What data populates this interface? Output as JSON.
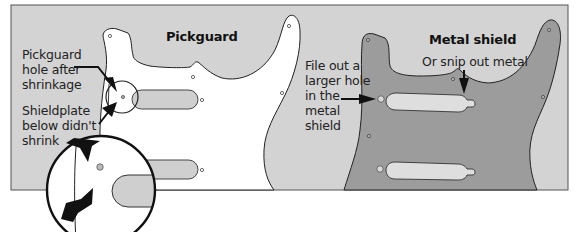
{
  "figure": {
    "panel_color": "#d3d3d3",
    "pickguard_color": "#ffffff",
    "shield_color": "#9c9c9c",
    "slot_color": "#cfcfcf",
    "outline_color": "#222222"
  },
  "left_panel": {
    "title": "Pickguard",
    "callouts": [
      {
        "text": "Pickguard\nhole after\nshrinkage",
        "points_to": "pickguard-hole"
      },
      {
        "text": "Shieldplate\nbelow didn't\nshrink",
        "points_to": "shieldplate-edge"
      }
    ]
  },
  "right_panel": {
    "title": "Metal shield",
    "callouts": [
      {
        "text": "File out a\nlarger hole\nin the\nmetal\nshield",
        "points_to": "shield-hole"
      },
      {
        "text": "Or snip out metal",
        "points_to": "slot-nub"
      }
    ]
  }
}
